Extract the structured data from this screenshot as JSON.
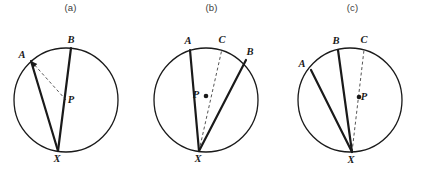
{
  "figure": {
    "background_color": "#ffffff",
    "stroke_color": "#1a1a1a",
    "circle_color": "#1a1a1a",
    "dash_color": "#555555",
    "title_color": "#3c3c3c",
    "chord_width": 2.2,
    "circle_width": 1.3,
    "dash_width": 1.0,
    "dash_pattern": "3,2.5"
  },
  "panels": [
    {
      "id": "a",
      "title": "(a)",
      "circle": {
        "cx": 66,
        "cy": 100,
        "r": 52
      },
      "center_point": {
        "label": "P",
        "x": 66,
        "y": 100,
        "dot": false,
        "label_dx": 5,
        "label_dy": 3
      },
      "points": [
        {
          "name": "A",
          "x": 31,
          "y": 61,
          "label_dx": -9,
          "label_dy": -3
        },
        {
          "name": "B",
          "x": 71,
          "y": 48,
          "label_dx": 0,
          "label_dy": -5
        },
        {
          "name": "X",
          "x": 58,
          "y": 151,
          "label_dx": -1,
          "label_dy": 11
        }
      ],
      "solid_segments": [
        {
          "from": "X",
          "to": "A"
        },
        {
          "from": "X",
          "to": "B"
        }
      ],
      "dashed_segments": [
        {
          "from": "A",
          "to": "P"
        }
      ],
      "arrow_targets": [
        "A"
      ]
    },
    {
      "id": "b",
      "title": "(b)",
      "circle": {
        "cx": 206,
        "cy": 100,
        "r": 52
      },
      "center_point": {
        "label": "P",
        "x": 206,
        "y": 96,
        "dot": true,
        "label_dx": -10,
        "label_dy": 2
      },
      "points": [
        {
          "name": "A",
          "x": 190,
          "y": 50,
          "label_dx": -2,
          "label_dy": -6
        },
        {
          "name": "C",
          "x": 222,
          "y": 49,
          "label_dx": 0,
          "label_dy": -6
        },
        {
          "name": "B",
          "x": 246,
          "y": 60,
          "label_dx": 4,
          "label_dy": -5
        },
        {
          "name": "X",
          "x": 199,
          "y": 151,
          "label_dx": -1,
          "label_dy": 11
        }
      ],
      "solid_segments": [
        {
          "from": "X",
          "to": "A"
        },
        {
          "from": "X",
          "to": "B"
        }
      ],
      "dashed_segments": [
        {
          "from": "X",
          "to": "C"
        }
      ],
      "arrow_targets": []
    },
    {
      "id": "c",
      "title": "(c)",
      "circle": {
        "cx": 350,
        "cy": 100,
        "r": 52
      },
      "center_point": {
        "label": "P",
        "x": 359,
        "y": 97,
        "dot": true,
        "label_dx": 5,
        "label_dy": 3
      },
      "points": [
        {
          "name": "B",
          "x": 338,
          "y": 50,
          "label_dx": -2,
          "label_dy": -6
        },
        {
          "name": "C",
          "x": 364,
          "y": 50,
          "label_dx": 0,
          "label_dy": -7
        },
        {
          "name": "A",
          "x": 311,
          "y": 70,
          "label_dx": -9,
          "label_dy": -3
        },
        {
          "name": "X",
          "x": 352,
          "y": 152,
          "label_dx": -1,
          "label_dy": 11
        }
      ],
      "solid_segments": [
        {
          "from": "X",
          "to": "A"
        },
        {
          "from": "X",
          "to": "B"
        }
      ],
      "dashed_segments": [
        {
          "from": "X",
          "to": "C"
        }
      ],
      "arrow_targets": []
    }
  ]
}
